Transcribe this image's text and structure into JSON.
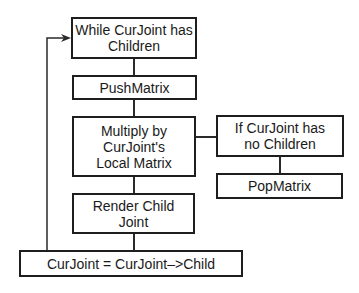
{
  "diagram": {
    "type": "flowchart",
    "nodes": [
      {
        "id": "while",
        "label": "While CurJoint has Children"
      },
      {
        "id": "push",
        "label": "PushMatrix"
      },
      {
        "id": "multiply",
        "label": "Multiply by CurJoint's Local Matrix"
      },
      {
        "id": "if_none",
        "label": "If CurJoint has no Children"
      },
      {
        "id": "pop",
        "label": "PopMatrix"
      },
      {
        "id": "render",
        "label": "Render Child Joint"
      },
      {
        "id": "advance",
        "label": "CurJoint = CurJoint–>Child"
      }
    ],
    "edges": [
      {
        "from": "while",
        "to": "push"
      },
      {
        "from": "push",
        "to": "multiply"
      },
      {
        "from": "multiply",
        "to": "if_none"
      },
      {
        "from": "if_none",
        "to": "pop"
      },
      {
        "from": "multiply",
        "to": "render"
      },
      {
        "from": "render",
        "to": "advance"
      },
      {
        "from": "advance",
        "to": "while",
        "arrow": true,
        "kind": "loop-back"
      }
    ],
    "colors": {
      "stroke": "#1e1e1e",
      "fill": "#ffffff",
      "text": "#1a1a1a"
    }
  }
}
